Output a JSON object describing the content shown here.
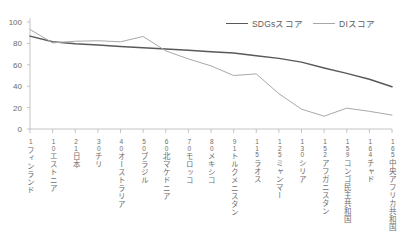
{
  "chart_data": {
    "type": "line",
    "title": "",
    "xlabel": "",
    "ylabel": "",
    "ylim": [
      0,
      100
    ],
    "yticks": [
      0,
      20,
      40,
      60,
      80,
      100
    ],
    "grid": false,
    "legend_position": "top-right",
    "categories": [
      "1 フィンランド",
      "10 エストニア",
      "21 日本",
      "30 チリ",
      "40 オーストラリア",
      "50 ブラジル",
      "60 北マケドニア",
      "70 モロッコ",
      "80 メキシコ",
      "91 トルクメニスタン",
      "115 ラオス",
      "125 ミャンマー",
      "130 シリア",
      "152 アフガニスタン",
      "159 コンゴ民主共和国",
      "164 チャド",
      "165 中央アフリカ共和国"
    ],
    "ranks": [
      "1",
      "10",
      "21",
      "30",
      "40",
      "50",
      "60",
      "70",
      "80",
      "91",
      "115",
      "125",
      "130",
      "152",
      "159",
      "164",
      "165"
    ],
    "country_names": [
      "フィンランド",
      "エストニア",
      "日本",
      "チリ",
      "オーストラリア",
      "ブラジル",
      "北マケドニア",
      "モロッコ",
      "メキシコ",
      "トルクメニスタン",
      "ミャンマー",
      "シリア",
      "アフガニスタン",
      "コンゴ民主共和国",
      "チャド",
      "中央アフリカ共和国"
    ],
    "series": [
      {
        "name": "SDGsスコア",
        "color": "#595959",
        "values": [
          86.8,
          81.5,
          79.6,
          78.4,
          77.2,
          76.0,
          74.8,
          73.5,
          72.3,
          71.0,
          68.5,
          66.0,
          62.5,
          57.0,
          52.0,
          46.5,
          39.5
        ]
      },
      {
        "name": "DIスコア",
        "color": "#a8a8a8",
        "values": [
          93.0,
          80.5,
          82.0,
          82.5,
          81.5,
          86.5,
          73.0,
          65.5,
          59.0,
          50.0,
          51.5,
          33.0,
          18.5,
          12.0,
          19.5,
          16.5,
          13.0
        ]
      }
    ]
  },
  "legend": {
    "entries": [
      {
        "label": "SDGsスコア",
        "color": "#595959"
      },
      {
        "label": "DIスコア",
        "color": "#a8a8a8"
      }
    ]
  },
  "axis": {
    "y_tick_labels": [
      "100",
      "80",
      "60",
      "40",
      "20",
      "0"
    ],
    "axis_color": "#b5b5b5"
  }
}
